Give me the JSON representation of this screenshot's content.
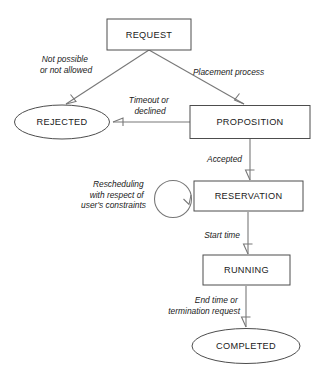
{
  "diagram": {
    "background_color": "#ffffff",
    "node_stroke_color": "#4d4d4d",
    "edge_stroke_color": "#787878",
    "text_color": "#1a1a1a",
    "states": [
      {
        "id": "request",
        "label": "REQUEST",
        "shape": "rectangle",
        "x": 149,
        "y": 34,
        "w": 84,
        "h": 31
      },
      {
        "id": "rejected",
        "label": "REJECTED",
        "shape": "ellipse",
        "x": 62,
        "y": 122,
        "w": 95,
        "h": 34
      },
      {
        "id": "proposition",
        "label": "PROPOSITION",
        "shape": "rectangle",
        "x": 250,
        "y": 122,
        "w": 120,
        "h": 33
      },
      {
        "id": "reservation",
        "label": "RESERVATION",
        "shape": "rectangle",
        "x": 248,
        "y": 196,
        "w": 109,
        "h": 30
      },
      {
        "id": "running",
        "label": "RUNNING",
        "shape": "rectangle",
        "x": 246,
        "y": 270,
        "w": 87,
        "h": 30
      },
      {
        "id": "completed",
        "label": "COMPLETED",
        "shape": "ellipse",
        "x": 246,
        "y": 346,
        "w": 108,
        "h": 35
      }
    ],
    "transitions": [
      {
        "id": "request-to-rejected",
        "from": "REQUEST",
        "to": "REJECTED",
        "label_lines": [
          "Not possible",
          "or not allowed"
        ],
        "label_align": "middle",
        "label_x": 66,
        "label_y": 62
      },
      {
        "id": "request-to-proposition",
        "from": "REQUEST",
        "to": "PROPOSITION",
        "label_lines": [
          "Placement process"
        ],
        "label_align": "start",
        "label_x": 193,
        "label_y": 75
      },
      {
        "id": "proposition-to-rejected",
        "from": "PROPOSITION",
        "to": "REJECTED",
        "label_lines": [
          "Timeout or",
          "declined"
        ],
        "label_align": "middle",
        "label_x": 150,
        "label_y": 103
      },
      {
        "id": "proposition-to-reservation",
        "from": "PROPOSITION",
        "to": "RESERVATION",
        "label_lines": [
          "Accepted"
        ],
        "label_align": "end",
        "label_x": 242,
        "label_y": 162
      },
      {
        "id": "reservation-self-loop",
        "from": "RESERVATION",
        "to": "RESERVATION",
        "label_lines": [
          "Rescheduling",
          "with respect of",
          "user's constraints"
        ],
        "label_align": "end",
        "label_x": 146,
        "label_y": 187
      },
      {
        "id": "reservation-to-running",
        "from": "RESERVATION",
        "to": "RUNNING",
        "label_lines": [
          "Start time"
        ],
        "label_align": "end",
        "label_x": 240,
        "label_y": 238
      },
      {
        "id": "running-to-completed",
        "from": "RUNNING",
        "to": "COMPLETED",
        "label_lines": [
          "End time or",
          "termination request"
        ],
        "label_align": "end",
        "label_x": 240,
        "label_y": 303
      }
    ]
  }
}
